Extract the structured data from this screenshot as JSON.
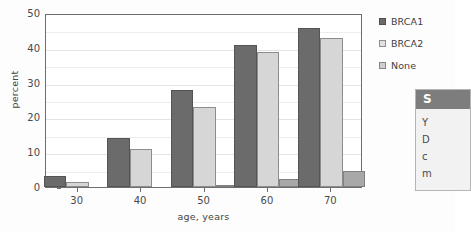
{
  "chart_data": {
    "type": "bar",
    "title": "",
    "xlabel": "age, years",
    "ylabel": "percent",
    "categories": [
      "30",
      "40",
      "50",
      "60",
      "70"
    ],
    "series": [
      {
        "name": "BRCA1",
        "color": "#6b6b6b",
        "values": [
          3.3,
          14.0,
          27.9,
          40.9,
          45.8
        ]
      },
      {
        "name": "BRCA2",
        "color": "#d6d6d6",
        "values": [
          1.3,
          11.0,
          22.9,
          38.8,
          42.7
        ]
      },
      {
        "name": "None",
        "color": "#a8a8a8",
        "values": [
          0.0,
          0.0,
          0.7,
          2.3,
          4.7
        ]
      }
    ],
    "ylim": [
      0,
      50
    ],
    "yticks": [
      0,
      10,
      20,
      30,
      40,
      50
    ],
    "yminor_gridlines": [
      5,
      15,
      25,
      35,
      45
    ],
    "grid": true,
    "legend_position": "right"
  },
  "legend": {
    "entries": [
      {
        "label": "BRCA1",
        "swatch": "legend-swatch-dark"
      },
      {
        "label": "BRCA2",
        "swatch": "legend-swatch-light"
      },
      {
        "label": "None",
        "swatch": "legend-swatch-medium"
      }
    ]
  },
  "side_panel": {
    "header": "S",
    "lines": [
      "Y",
      "D",
      "c",
      "m"
    ]
  }
}
